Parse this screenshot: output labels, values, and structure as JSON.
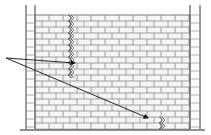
{
  "diagram": {
    "colors": {
      "background": "#ffffff",
      "line": "#3a3a3a",
      "mortar": "#8a8a8a",
      "brick_fill": "#f4f4f4"
    },
    "wall": {
      "x": 35,
      "y": 15,
      "width": 155,
      "height": 114,
      "brick_w": 14,
      "brick_h": 6
    },
    "pillars": [
      {
        "name": "left",
        "x1": 26,
        "x2": 35,
        "y_top": 5,
        "y_bottom": 129
      },
      {
        "name": "right",
        "x1": 190,
        "x2": 200,
        "y_top": 5,
        "y_bottom": 129
      }
    ],
    "ground": {
      "y": 130,
      "x1": 20,
      "x2": 205
    },
    "cracks": [
      {
        "name": "upper-vertical-crack",
        "x": 70,
        "y1": 15,
        "y2": 80
      },
      {
        "name": "lower-crack",
        "x": 161,
        "y1": 117,
        "y2": 129
      }
    ],
    "arrows": [
      {
        "name": "arrow-to-upper-crack",
        "from": [
          6,
          58
        ],
        "to": [
          75,
          63
        ]
      },
      {
        "name": "arrow-to-lower-crack",
        "from": [
          6,
          58
        ],
        "to": [
          148,
          118
        ]
      }
    ]
  }
}
